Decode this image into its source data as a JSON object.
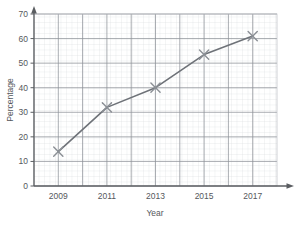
{
  "chart_data": {
    "type": "line",
    "title": "",
    "xlabel": "Year",
    "ylabel": "Percentage",
    "x": [
      2009,
      2011,
      2013,
      2015,
      2017
    ],
    "categories": [
      "2009",
      "2011",
      "2013",
      "2015",
      "2017"
    ],
    "values": [
      14,
      32,
      40,
      53.5,
      61
    ],
    "series": [
      {
        "name": "Percentage",
        "values": [
          14,
          32,
          40,
          53.5,
          61
        ]
      }
    ],
    "xlim": [
      2008,
      2018
    ],
    "ylim": [
      0,
      70
    ],
    "y_ticks": [
      "0",
      "10",
      "20",
      "30",
      "40",
      "50",
      "60",
      "70"
    ],
    "y_tick_values": [
      0,
      10,
      20,
      30,
      40,
      50,
      60,
      70
    ],
    "x_ticks": [
      "2009",
      "2011",
      "2013",
      "2015",
      "2017"
    ],
    "grid": true,
    "minor_grid": true,
    "legend": "none",
    "marker": "x",
    "line_color": "#6e7278",
    "marker_color": "#8b8f95",
    "major_grid_color": "#8e9298",
    "minor_grid_color": "#d2d6da",
    "axis_color": "#5a5d61",
    "text_color": "#55585c"
  },
  "axes": {
    "x_title": "Year",
    "y_title": "Percentage"
  }
}
